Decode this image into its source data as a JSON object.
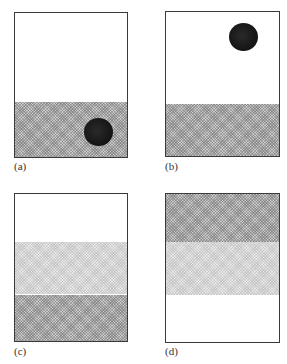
{
  "figure": {
    "panels": [
      {
        "id": "a",
        "label": "(a)",
        "bands": [
          {
            "type": "dark",
            "from_fraction": 0.61,
            "to_fraction": 1.0
          }
        ],
        "ball": {
          "present": true,
          "position": "bottom-right, inside dark layer"
        }
      },
      {
        "id": "b",
        "label": "(b)",
        "bands": [
          {
            "type": "dark",
            "from_fraction": 0.64,
            "to_fraction": 1.0
          }
        ],
        "ball": {
          "present": true,
          "position": "top-right, in white layer"
        }
      },
      {
        "id": "c",
        "label": "(c)",
        "bands": [
          {
            "type": "light",
            "from_fraction": 0.33,
            "to_fraction": 0.69
          },
          {
            "type": "dark",
            "from_fraction": 0.69,
            "to_fraction": 1.0
          }
        ],
        "ball": {
          "present": false
        }
      },
      {
        "id": "d",
        "label": "(d)",
        "bands": [
          {
            "type": "dark",
            "from_fraction": 0.0,
            "to_fraction": 0.33
          },
          {
            "type": "light",
            "from_fraction": 0.33,
            "to_fraction": 0.69
          }
        ],
        "ball": {
          "present": false
        }
      }
    ]
  }
}
